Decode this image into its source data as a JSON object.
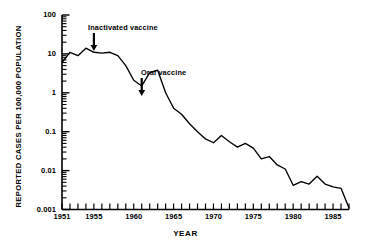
{
  "chart_data": {
    "type": "line",
    "title": "",
    "xlabel": "YEAR",
    "ylabel": "REPORTED CASES PER 100,000 POPULATION",
    "yscale": "log",
    "ylim": [
      0.001,
      100
    ],
    "xlim": [
      1951,
      1987
    ],
    "grid": false,
    "legend": null,
    "y_tick_labels": [
      "100",
      "10",
      "1",
      "0.1",
      "0.01",
      "0.001"
    ],
    "y_tick_values": [
      100,
      10,
      1,
      0.1,
      0.01,
      0.001
    ],
    "x_tick_labels": [
      "1951",
      "1955",
      "1960",
      "1965",
      "1970",
      "1975",
      "1980",
      "1985"
    ],
    "x_tick_values": [
      1951,
      1955,
      1960,
      1965,
      1970,
      1975,
      1980,
      1985
    ],
    "x_minor_tick_step": 1,
    "series": [
      {
        "name": "Reported poliomyelitis cases per 100,000 population",
        "x": [
          1951,
          1952,
          1953,
          1954,
          1955,
          1956,
          1957,
          1958,
          1959,
          1960,
          1961,
          1962,
          1963,
          1964,
          1965,
          1966,
          1967,
          1968,
          1969,
          1970,
          1971,
          1972,
          1973,
          1974,
          1975,
          1976,
          1977,
          1978,
          1979,
          1980,
          1981,
          1982,
          1983,
          1984,
          1985,
          1986,
          1987
        ],
        "values": [
          6.0,
          11.0,
          9.0,
          14.0,
          11.0,
          10.5,
          11.0,
          9.0,
          5.0,
          2.1,
          1.5,
          3.3,
          3.8,
          1.0,
          0.4,
          0.28,
          0.16,
          0.1,
          0.065,
          0.052,
          0.08,
          0.055,
          0.04,
          0.05,
          0.038,
          0.02,
          0.023,
          0.014,
          0.011,
          0.0042,
          0.0052,
          0.0045,
          0.0072,
          0.0045,
          0.0038,
          0.0035,
          0.0011
        ]
      }
    ],
    "annotations": [
      {
        "label": "Inactivated vaccine",
        "x_year": 1955,
        "marker": "down-arrow"
      },
      {
        "label": "Oral vaccine",
        "x_year": 1961,
        "marker": "down-arrow"
      }
    ]
  },
  "axes": {
    "y_title": "REPORTED CASES PER 100,000 POPULATION",
    "x_title": "YEAR"
  },
  "colors": {
    "line": "#000000",
    "axis": "#000000",
    "background": "#ffffff"
  }
}
